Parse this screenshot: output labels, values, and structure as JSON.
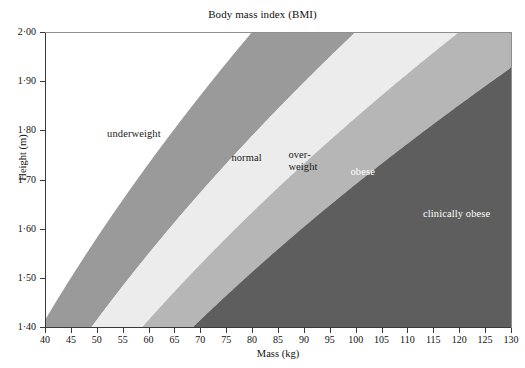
{
  "chart_data": {
    "type": "area",
    "title": "Body mass index (BMI)",
    "xlabel": "Mass (kg)",
    "ylabel": "Height (m)",
    "xlim": [
      40,
      130
    ],
    "ylim": [
      1.4,
      2.0
    ],
    "xticks": [
      40,
      45,
      50,
      55,
      60,
      65,
      70,
      75,
      80,
      85,
      90,
      95,
      100,
      105,
      110,
      115,
      120,
      125,
      130
    ],
    "ytick_values": [
      1.4,
      1.5,
      1.6,
      1.7,
      1.8,
      1.9,
      2.0
    ],
    "ytick_labels": [
      "1·40",
      "1·50",
      "1·60",
      "1·70",
      "1·80",
      "1·90",
      "2·00"
    ],
    "grid": false,
    "legend": "none",
    "note": "Shaded regions are BMI = mass / height^2 bands; boundaries are the isolines BMI = 20, 25, 30, 35.",
    "boundaries": [
      {
        "name": "underweight-normal",
        "bmi": 20
      },
      {
        "name": "normal-overweight",
        "bmi": 25
      },
      {
        "name": "overweight-obese",
        "bmi": 30
      },
      {
        "name": "obese-clinically-obese",
        "bmi": 35
      }
    ],
    "regions": [
      {
        "key": "underweight",
        "label": "underweight",
        "bmi_range": [
          0,
          20
        ],
        "color": "#ffffff",
        "text_color": "#1a1a1a",
        "label_x_kg": 52,
        "label_y_m": 1.805
      },
      {
        "key": "normal",
        "label": "normal",
        "bmi_range": [
          20,
          25
        ],
        "color": "#9a9a9a",
        "text_color": "#1a1a1a",
        "label_x_kg": 76,
        "label_y_m": 1.757
      },
      {
        "key": "overweight",
        "label": "over-\nweight",
        "bmi_range": [
          25,
          30
        ],
        "color": "#ececec",
        "text_color": "#1a1a1a",
        "label_x_kg": 87,
        "label_y_m": 1.762
      },
      {
        "key": "obese",
        "label": "obese",
        "bmi_range": [
          30,
          35
        ],
        "color": "#b6b6b6",
        "text_color": "#ffffff",
        "label_x_kg": 99,
        "label_y_m": 1.727
      },
      {
        "key": "clinically-obese",
        "label": "clinically obese",
        "bmi_range": [
          35,
          100
        ],
        "color": "#5e5e5e",
        "text_color": "#ffffff",
        "label_x_kg": 113,
        "label_y_m": 1.642
      }
    ]
  }
}
